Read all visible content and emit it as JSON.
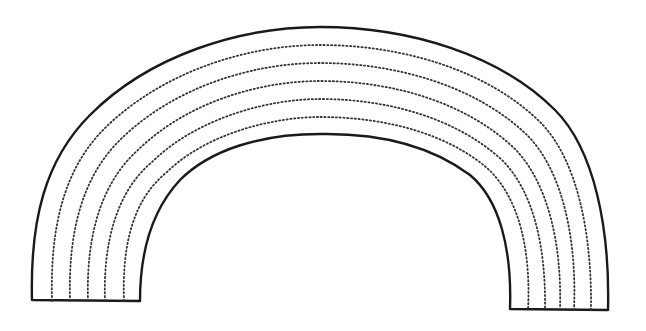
{
  "figure": {
    "type": "line-art rainbow outline",
    "band_count": 6,
    "divider_count": 5,
    "outline_color": "#1a1a1a",
    "divider_color": "#333333",
    "divider_style": "dotted",
    "background": "#ffffff"
  }
}
